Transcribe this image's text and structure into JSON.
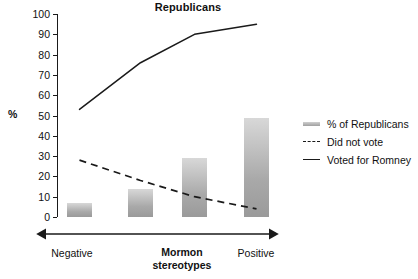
{
  "chart_data": {
    "type": "bar",
    "title": "Republicans",
    "xlabel": "Mormon stereotypes",
    "ylabel": "%",
    "ylim": [
      0,
      100
    ],
    "ytick_step": 10,
    "grid": false,
    "legend_position": "right",
    "categories": [
      "Negative",
      "",
      "",
      "Positive"
    ],
    "x_axis_endpoints": [
      "Negative",
      "Positive"
    ],
    "yticks": [
      "0",
      "10",
      "20",
      "30",
      "40",
      "50",
      "60",
      "70",
      "80",
      "90",
      "100"
    ],
    "series": [
      {
        "name": "% of Republicans",
        "type": "bar",
        "values": [
          7,
          14,
          29,
          49
        ]
      },
      {
        "name": "Did not vote",
        "type": "line",
        "style": "dashed",
        "values": [
          28,
          18,
          10,
          4
        ]
      },
      {
        "name": "Voted for Romney",
        "type": "line",
        "style": "solid",
        "values": [
          53,
          76,
          90,
          95
        ]
      }
    ]
  },
  "chart": {
    "title": "Republicans",
    "y_axis_title": "%",
    "x_axis_title_line1": "Mormon",
    "x_axis_title_line2": "stereotypes",
    "x_label_left": "Negative",
    "x_label_right": "Positive"
  },
  "legend": {
    "items": [
      {
        "label": "% of Republicans",
        "swatch": "bar-swatch-icon"
      },
      {
        "label": "Did not vote",
        "swatch": "dashed-line-icon"
      },
      {
        "label": "Voted for Romney",
        "swatch": "solid-line-icon"
      }
    ]
  },
  "colors": {
    "bar_top": "#d8d8d8",
    "bar_bottom": "#9a9a9a",
    "axis": "#1a1a1a",
    "text": "#111111",
    "background": "#ffffff"
  }
}
